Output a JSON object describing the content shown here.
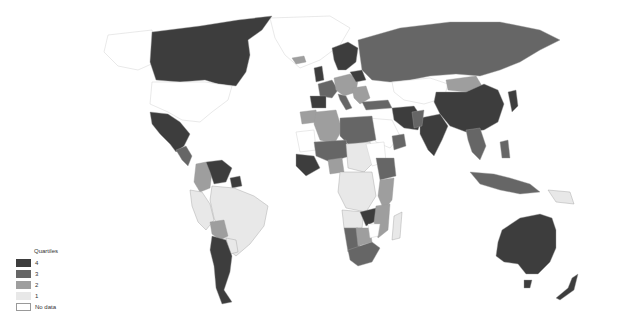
{
  "map": {
    "type": "choropleth",
    "projection": "world",
    "colors": {
      "q4": "#3d3d3d",
      "q3": "#666666",
      "q2": "#9e9e9e",
      "q1": "#e8e8e8",
      "no_data": "#ffffff"
    }
  },
  "legend": {
    "title": "Quartiles",
    "items": [
      {
        "label": "4",
        "key": "q4",
        "color": "#3d3d3d"
      },
      {
        "label": "3",
        "key": "q3",
        "color": "#666666"
      },
      {
        "label": "2",
        "key": "q2",
        "color": "#9e9e9e"
      },
      {
        "label": "1",
        "key": "q1",
        "color": "#e8e8e8"
      },
      {
        "label": "No data",
        "key": "no_data",
        "color": "#ffffff"
      }
    ]
  }
}
